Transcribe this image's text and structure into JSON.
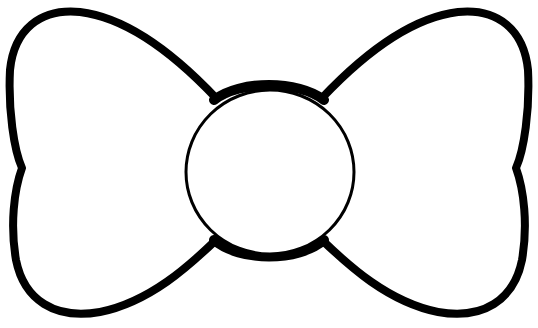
{
  "image": {
    "subject": "bow-tie outline",
    "colors": {
      "stroke": "#000000",
      "fill": "#ffffff",
      "background": "#ffffff"
    },
    "parts": [
      "left-wing",
      "right-wing",
      "center-knot"
    ]
  }
}
